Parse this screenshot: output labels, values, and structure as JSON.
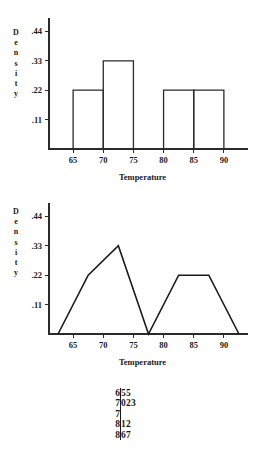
{
  "chart_data": [
    {
      "type": "bar",
      "title": "",
      "xlabel": "Temperature",
      "ylabel": "Density",
      "ylabel_letters": [
        "D",
        "e",
        "n",
        "s",
        "i",
        "t",
        "y"
      ],
      "categories": [
        "65-70",
        "70-75",
        "75-80",
        "80-85",
        "85-90"
      ],
      "bin_edges": [
        65,
        70,
        75,
        80,
        85,
        90
      ],
      "values": [
        0.22,
        0.33,
        0,
        0.22,
        0.22
      ],
      "xticks": [
        65,
        70,
        75,
        80,
        85,
        90
      ],
      "xtick_labels": [
        "65",
        "70",
        "75",
        "80",
        "85",
        "90"
      ],
      "yticks": [
        0.11,
        0.22,
        0.33,
        0.44
      ],
      "ytick_labels": [
        ".11",
        ".22",
        ".33",
        ".44"
      ],
      "xlim": [
        61,
        94
      ],
      "ylim": [
        0,
        0.49
      ],
      "grid": false,
      "legend": "none"
    },
    {
      "type": "line",
      "title": "",
      "xlabel": "Temperature",
      "ylabel": "Density",
      "ylabel_letters": [
        "D",
        "e",
        "n",
        "s",
        "i",
        "t",
        "y"
      ],
      "x": [
        62.5,
        67.5,
        72.5,
        77.5,
        82.5,
        87.5,
        92.5
      ],
      "values": [
        0,
        0.22,
        0.33,
        0,
        0.22,
        0.22,
        0
      ],
      "xticks": [
        65,
        70,
        75,
        80,
        85,
        90
      ],
      "xtick_labels": [
        "65",
        "70",
        "75",
        "80",
        "85",
        "90"
      ],
      "yticks": [
        0.11,
        0.22,
        0.33,
        0.44
      ],
      "ytick_labels": [
        ".11",
        ".22",
        ".33",
        ".44"
      ],
      "xlim": [
        61,
        94
      ],
      "ylim": [
        0,
        0.49
      ],
      "grid": false,
      "legend": "none"
    }
  ],
  "stemleaf": {
    "rows": [
      {
        "stem": "6",
        "leaves": "55"
      },
      {
        "stem": "7",
        "leaves": "023"
      },
      {
        "stem": "7",
        "leaves": ""
      },
      {
        "stem": "8",
        "leaves": "12"
      },
      {
        "stem": "8",
        "leaves": "67"
      }
    ]
  }
}
